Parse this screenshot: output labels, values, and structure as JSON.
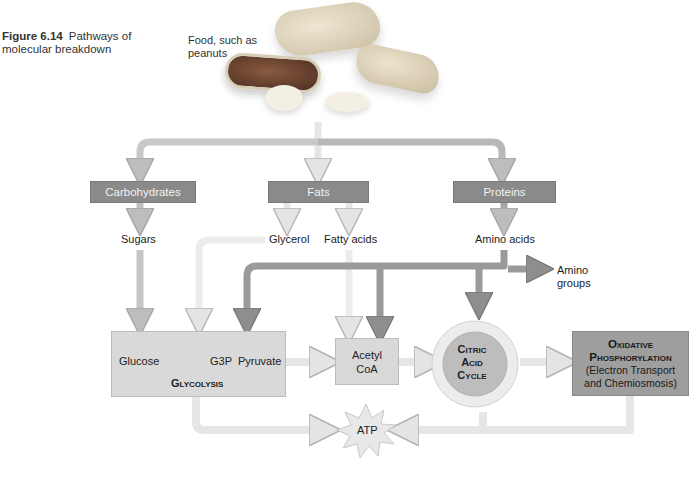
{
  "caption": {
    "figure_number": "Figure 6.14",
    "title_line1": "Pathways of",
    "title_line2": "molecular breakdown"
  },
  "food": {
    "label_line1": "Food, such as",
    "label_line2": "peanuts",
    "image": "peanuts-photo"
  },
  "categories": [
    {
      "label": "Carbohydrates"
    },
    {
      "label": "Fats"
    },
    {
      "label": "Proteins"
    }
  ],
  "products": {
    "sugars": "Sugars",
    "glycerol": "Glycerol",
    "fatty_acids": "Fatty acids",
    "amino_acids": "Amino acids",
    "amino_groups_line1": "Amino",
    "amino_groups_line2": "groups"
  },
  "glycolysis": {
    "glucose": "Glucose",
    "g3p": "G3P",
    "pyruvate": "Pyruvate",
    "title": "Glycolysis"
  },
  "acetyl_coa": {
    "line1": "Acetyl",
    "line2": "CoA"
  },
  "citric_acid_cycle": {
    "line1": "Citric",
    "line2": "Acid",
    "line3": "Cycle"
  },
  "oxidative_phosphorylation": {
    "title_line1": "Oxidative",
    "title_line2": "Phosphorylation",
    "sub_line1": "(Electron Transport",
    "sub_line2": "and Chemiosmosis)"
  },
  "atp": {
    "label": "ATP"
  },
  "colors": {
    "category_box": "#8a8a8a",
    "process_box": "#d9d9d9",
    "oxphos_box": "#9e9e9e",
    "light_arrow": "#e6e6e6",
    "mid_arrow": "#bcbcbc",
    "dark_arrow": "#8f8f8f"
  }
}
